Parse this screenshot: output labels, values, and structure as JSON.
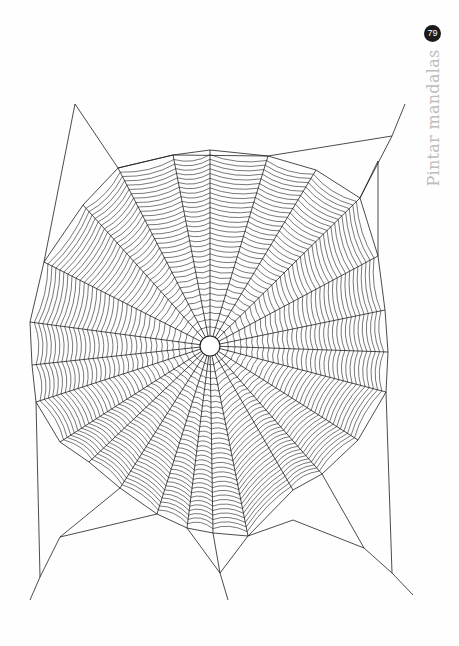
{
  "page": {
    "number": "79",
    "section_title": "Pintar mandalas"
  },
  "illustration": {
    "subject": "spider-web",
    "stroke_color": "#1e1e1e",
    "hub": {
      "x": 210,
      "y": 346,
      "r": 10
    },
    "spiral_rings": 34,
    "anchors": [
      [
        210,
        150
      ],
      [
        268,
        156
      ],
      [
        316,
        170
      ],
      [
        360,
        198
      ],
      [
        378,
        256
      ],
      [
        385,
        310
      ],
      [
        388,
        352
      ],
      [
        386,
        392
      ],
      [
        358,
        440
      ],
      [
        322,
        474
      ],
      [
        293,
        490
      ],
      [
        248,
        536
      ],
      [
        213,
        533
      ],
      [
        187,
        528
      ],
      [
        157,
        514
      ],
      [
        120,
        488
      ],
      [
        89,
        462
      ],
      [
        60,
        442
      ],
      [
        36,
        402
      ],
      [
        32,
        365
      ],
      [
        30,
        322
      ],
      [
        44,
        262
      ],
      [
        83,
        205
      ],
      [
        118,
        168
      ],
      [
        173,
        155
      ]
    ],
    "frame_lines": [
      [
        [
          75,
          104
        ],
        [
          44,
          262
        ]
      ],
      [
        [
          75,
          104
        ],
        [
          118,
          168
        ]
      ],
      [
        [
          118,
          168
        ],
        [
          173,
          155
        ]
      ],
      [
        [
          173,
          155
        ],
        [
          268,
          156
        ]
      ],
      [
        [
          268,
          156
        ],
        [
          392,
          136
        ]
      ],
      [
        [
          392,
          136
        ],
        [
          360,
          198
        ]
      ],
      [
        [
          392,
          136
        ],
        [
          405,
          104
        ]
      ],
      [
        [
          378,
          161
        ],
        [
          378,
          256
        ]
      ],
      [
        [
          378,
          161
        ],
        [
          360,
          198
        ]
      ],
      [
        [
          386,
          392
        ],
        [
          392,
          573
        ]
      ],
      [
        [
          392,
          573
        ],
        [
          413,
          595
        ]
      ],
      [
        [
          392,
          573
        ],
        [
          364,
          548
        ]
      ],
      [
        [
          364,
          548
        ],
        [
          322,
          474
        ]
      ],
      [
        [
          364,
          548
        ],
        [
          293,
          520
        ]
      ],
      [
        [
          293,
          520
        ],
        [
          248,
          536
        ]
      ],
      [
        [
          248,
          536
        ],
        [
          220,
          573
        ]
      ],
      [
        [
          220,
          573
        ],
        [
          228,
          600
        ]
      ],
      [
        [
          220,
          573
        ],
        [
          187,
          528
        ]
      ],
      [
        [
          220,
          573
        ],
        [
          213,
          533
        ]
      ],
      [
        [
          60,
          537
        ],
        [
          120,
          488
        ]
      ],
      [
        [
          60,
          537
        ],
        [
          157,
          514
        ]
      ],
      [
        [
          60,
          537
        ],
        [
          40,
          577
        ]
      ],
      [
        [
          40,
          577
        ],
        [
          30,
          600
        ]
      ],
      [
        [
          40,
          577
        ],
        [
          36,
          402
        ]
      ]
    ]
  }
}
